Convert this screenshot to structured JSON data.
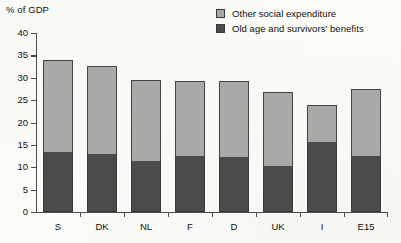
{
  "chart_data": {
    "type": "bar",
    "subtype": "stacked",
    "title": "",
    "xlabel": "",
    "ylabel": "% of GDP",
    "ylim": [
      0,
      40
    ],
    "yticks": [
      0,
      5,
      10,
      15,
      20,
      25,
      30,
      35,
      40
    ],
    "ytick_labels": [
      "0",
      "5",
      "10",
      "15",
      "20",
      "25",
      "30",
      "35",
      "40"
    ],
    "grid": false,
    "legend_position": "top-right",
    "categories": [
      "S",
      "DK",
      "NL",
      "F",
      "D",
      "UK",
      "I",
      "E15"
    ],
    "series": [
      {
        "name": "Old age and survivors' benefits",
        "color": "#4b4b4b",
        "values": [
          13.4,
          13.0,
          11.4,
          12.5,
          12.4,
          10.3,
          15.6,
          12.5
        ]
      },
      {
        "name": "Other social expenditure",
        "color": "#a9a9a7",
        "values": [
          20.6,
          19.6,
          18.1,
          16.8,
          16.9,
          16.5,
          8.3,
          15.0
        ]
      }
    ],
    "totals": [
      34.0,
      32.6,
      29.5,
      29.3,
      29.3,
      26.8,
      23.9,
      27.5
    ]
  },
  "legend": {
    "items": [
      {
        "label": "Other social expenditure",
        "swatch_icon": "light-gray-square"
      },
      {
        "label": "Old age and survivors' benefits",
        "swatch_icon": "dark-gray-square"
      }
    ]
  },
  "axis": {
    "y_title": "% of GDP"
  }
}
